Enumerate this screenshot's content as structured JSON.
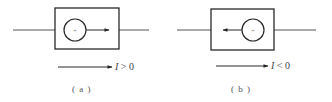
{
  "panels": [
    {
      "id": "a",
      "caption": "( a )",
      "current_label_var": "I",
      "current_label_rel": " > 0",
      "inner_arrow_direction": "right",
      "box": {
        "x": 55,
        "y": 8,
        "w": 64,
        "h": 41
      },
      "wire_y": 30,
      "wire_left": [
        13,
        55
      ],
      "wire_right": [
        119,
        149
      ],
      "circle": {
        "cx": 75,
        "cy": 30,
        "r": 11
      },
      "inner_arrow": {
        "x1": 86,
        "x2": 109
      },
      "ref_arrow": {
        "x1": 58,
        "x2": 112,
        "y": 67
      },
      "label_pos": {
        "x": 115,
        "y": 61
      },
      "caption_pos": {
        "x": 72,
        "y": 84
      }
    },
    {
      "id": "b",
      "caption": "( b )",
      "current_label_var": "I",
      "current_label_rel": " < 0",
      "inner_arrow_direction": "left",
      "box": {
        "x": 211,
        "y": 9,
        "w": 63,
        "h": 41
      },
      "wire_y": 30,
      "wire_left": [
        177,
        211
      ],
      "wire_right": [
        274,
        316
      ],
      "circle": {
        "cx": 253,
        "cy": 30,
        "r": 11
      },
      "inner_arrow": {
        "x1": 242,
        "x2": 223
      },
      "ref_arrow": {
        "x1": 216,
        "x2": 268,
        "y": 66
      },
      "label_pos": {
        "x": 271,
        "y": 60
      },
      "caption_pos": {
        "x": 231,
        "y": 84
      }
    }
  ],
  "symbols": {
    "source_sign": "+"
  },
  "colors": {
    "stroke": "#2a2a2a",
    "wire": "#555555",
    "text": "#444444"
  }
}
